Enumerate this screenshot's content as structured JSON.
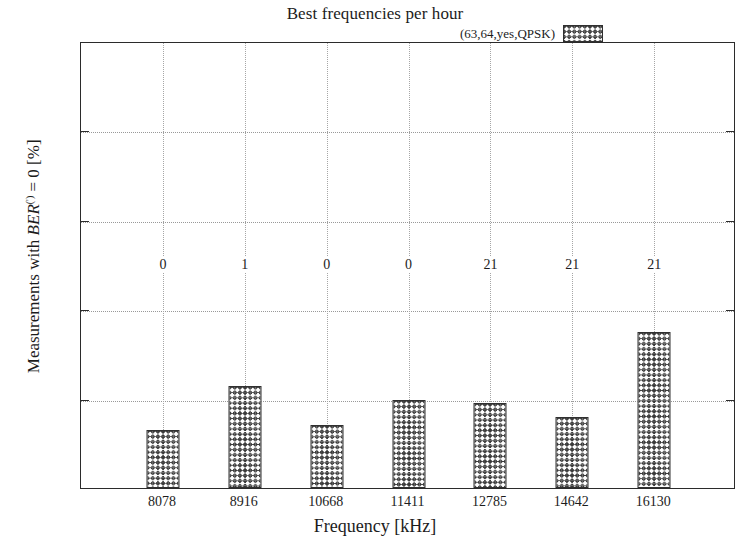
{
  "chart_data": {
    "type": "bar",
    "title": "Best frequencies per hour",
    "xlabel": "Frequency [kHz]",
    "ylabel_plain": "Measurements with BER(') = 0 [%]",
    "ylabel_parts": {
      "prefix": "Measurements with ",
      "math_var": "BER",
      "superscript": "(')",
      "suffix": " = 0 [%]"
    },
    "categories": [
      "8078",
      "8916",
      "10668",
      "11411",
      "12785",
      "14642",
      "16130"
    ],
    "values": [
      13.0,
      22.8,
      14.0,
      19.8,
      19.0,
      15.8,
      34.8
    ],
    "point_labels": [
      "0",
      "1",
      "0",
      "0",
      "21",
      "21",
      "21"
    ],
    "point_label_y": 50,
    "ylim": [
      0,
      100
    ],
    "yticks": [
      0,
      20,
      40,
      60,
      80,
      100
    ],
    "ytick_labels": [
      "0",
      "20",
      "40",
      "60",
      "80",
      "100"
    ],
    "grid": "dotted-both-axes",
    "legend": {
      "position": "top-right-inside",
      "entries": [
        {
          "label": "(63,64,yes,QPSK)",
          "pattern": "crosshatch"
        }
      ]
    },
    "colors": {
      "axis": "#2b2b2b",
      "grid": "#a6a6a6",
      "bar_edge": "#303030",
      "bar_fill_hatch": "#3a3a3a",
      "background": "#ffffff",
      "text": "#1c1c1c"
    }
  }
}
